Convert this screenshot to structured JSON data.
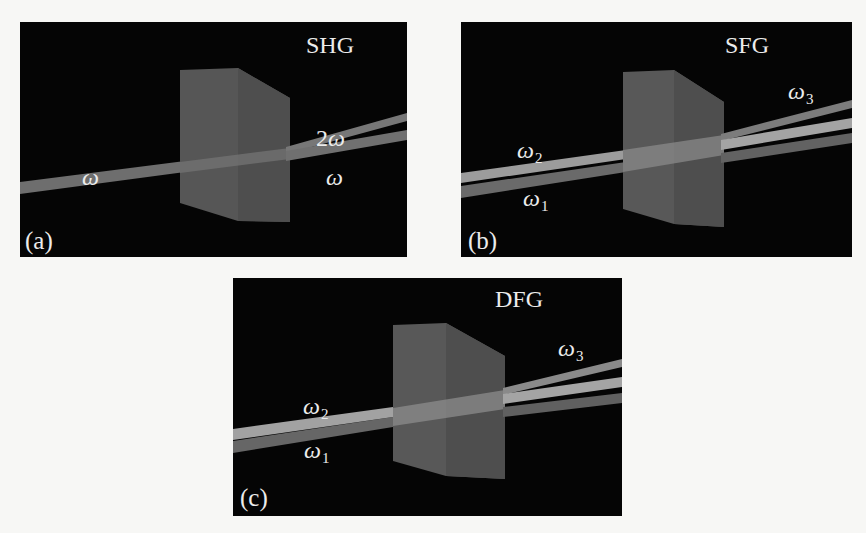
{
  "figure": {
    "panels": [
      {
        "id": "a",
        "tag": "(a)",
        "title": "SHG",
        "process": "Second Harmonic Generation",
        "labels": {
          "input": {
            "symbol": "ω",
            "sub": ""
          },
          "output_harmonic": {
            "prefix": "2",
            "symbol": "ω"
          },
          "output_fundamental": {
            "symbol": "ω",
            "sub": ""
          }
        }
      },
      {
        "id": "b",
        "tag": "(b)",
        "title": "SFG",
        "process": "Sum Frequency Generation",
        "labels": {
          "input_2": {
            "symbol": "ω",
            "sub": "2"
          },
          "input_1": {
            "symbol": "ω",
            "sub": "1"
          },
          "output_3": {
            "symbol": "ω",
            "sub": "3"
          }
        }
      },
      {
        "id": "c",
        "tag": "(c)",
        "title": "DFG",
        "process": "Difference Frequency Generation",
        "labels": {
          "input_2": {
            "symbol": "ω",
            "sub": "2"
          },
          "input_1": {
            "symbol": "ω",
            "sub": "1"
          },
          "output_3": {
            "symbol": "ω",
            "sub": "3"
          }
        }
      }
    ],
    "colors": {
      "background": "#f7f7f5",
      "panel": "#050505",
      "crystal_front": "#5a5a5a",
      "crystal_side": "#4a4a4a",
      "beam_bright": "#a8a8a8",
      "beam_mid": "#7c7c7c",
      "beam_dim": "#5e5e5e",
      "text": "#ececec"
    }
  }
}
